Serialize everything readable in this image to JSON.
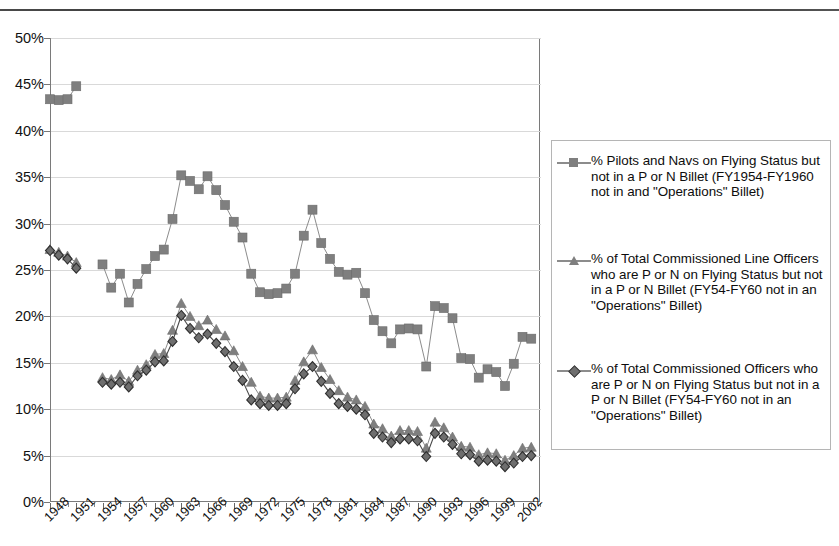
{
  "chart_data": {
    "type": "line",
    "title": "",
    "xlabel": "",
    "ylabel": "",
    "ylim": [
      0,
      50
    ],
    "ytick_labels": [
      "0%",
      "5%",
      "10%",
      "15%",
      "20%",
      "25%",
      "30%",
      "35%",
      "40%",
      "45%",
      "50%"
    ],
    "ytick_values": [
      0,
      5,
      10,
      15,
      20,
      25,
      30,
      35,
      40,
      45,
      50
    ],
    "grid": true,
    "legend_position": "right",
    "x": [
      1948,
      1949,
      1950,
      1951,
      1952,
      1953,
      1954,
      1955,
      1956,
      1957,
      1958,
      1959,
      1960,
      1961,
      1962,
      1963,
      1964,
      1965,
      1966,
      1967,
      1968,
      1969,
      1970,
      1971,
      1972,
      1973,
      1974,
      1975,
      1976,
      1977,
      1978,
      1979,
      1980,
      1981,
      1982,
      1983,
      1984,
      1985,
      1986,
      1987,
      1988,
      1989,
      1990,
      1991,
      1992,
      1993,
      1994,
      1995,
      1996,
      1997,
      1998,
      1999,
      2000,
      2001,
      2002,
      2003,
      2004
    ],
    "xtick_labels": [
      "1948",
      "1951",
      "1954",
      "1957",
      "1960",
      "1963",
      "1966",
      "1969",
      "1972",
      "1975",
      "1978",
      "1981",
      "1984",
      "1987",
      "1990",
      "1993",
      "1996",
      "1999",
      "2002"
    ],
    "xtick_values": [
      1948,
      1951,
      1954,
      1957,
      1960,
      1963,
      1966,
      1969,
      1972,
      1975,
      1978,
      1981,
      1984,
      1987,
      1990,
      1993,
      1996,
      1999,
      2002
    ],
    "series": [
      {
        "name": "% Pilots and Navs on Flying Status but not in a P or N Billet (FY1954-FY1960 not in and \"Operations\" Billet)",
        "marker": "square",
        "color": "#7f7f7f",
        "values": [
          43.4,
          43.3,
          43.4,
          44.8,
          null,
          null,
          25.6,
          23.1,
          24.6,
          21.5,
          23.5,
          25.1,
          26.5,
          27.2,
          30.5,
          35.2,
          34.6,
          33.7,
          35.1,
          33.6,
          32.0,
          30.2,
          28.5,
          24.6,
          22.6,
          22.4,
          22.5,
          23.0,
          24.6,
          28.7,
          31.5,
          27.9,
          26.2,
          24.8,
          24.5,
          24.7,
          22.5,
          19.6,
          18.4,
          17.1,
          18.6,
          18.7,
          18.6,
          14.6,
          21.1,
          20.9,
          19.8,
          15.5,
          15.4,
          13.4,
          14.3,
          14.0,
          12.5,
          14.9,
          17.8,
          17.6,
          null
        ]
      },
      {
        "name": "% of Total Commissioned Line Officers who are P or N on Flying Status but not in a P or N Billet (FY54-FY60 not in an \"Operations\" Billet)",
        "marker": "triangle",
        "color": "#7f7f7f",
        "values": [
          27.2,
          26.9,
          26.5,
          25.8,
          null,
          null,
          13.4,
          13.2,
          13.7,
          13.0,
          14.2,
          14.8,
          15.9,
          16.0,
          18.5,
          21.4,
          20.0,
          19.0,
          19.6,
          18.6,
          17.9,
          16.3,
          14.6,
          12.9,
          11.4,
          11.2,
          11.2,
          11.3,
          13.1,
          15.1,
          16.4,
          14.5,
          13.2,
          12.0,
          11.3,
          11.0,
          10.3,
          8.4,
          7.9,
          7.1,
          7.7,
          7.7,
          7.6,
          5.8,
          8.6,
          8.0,
          7.0,
          6.0,
          5.9,
          5.1,
          5.3,
          5.2,
          4.5,
          5.0,
          5.8,
          5.9,
          null
        ]
      },
      {
        "name": "% of Total Commissioned Officers who are P or N on Flying Status but not in a P or N Billet (FY54-FY60 not in an \"Operations\" Billet)",
        "marker": "diamond",
        "color": "#6e6e6e",
        "values": [
          27.1,
          26.6,
          26.2,
          25.2,
          null,
          null,
          12.9,
          12.7,
          12.9,
          12.4,
          13.6,
          14.2,
          15.1,
          15.2,
          17.3,
          20.1,
          18.7,
          17.7,
          18.1,
          17.1,
          16.2,
          14.6,
          13.1,
          11.0,
          10.6,
          10.4,
          10.4,
          10.6,
          12.2,
          13.8,
          14.6,
          13.0,
          11.7,
          10.6,
          10.3,
          10.0,
          9.4,
          7.4,
          7.0,
          6.4,
          6.8,
          6.8,
          6.6,
          4.9,
          7.4,
          7.0,
          6.2,
          5.2,
          5.1,
          4.4,
          4.5,
          4.4,
          3.8,
          4.2,
          4.9,
          5.0,
          null
        ]
      }
    ]
  },
  "legend": {
    "entries": [
      {
        "marker_name": "square-marker",
        "label": "% Pilots and Navs on Flying Status but not in a P or N Billet (FY1954-FY1960 not in and \"Operations\" Billet)"
      },
      {
        "marker_name": "triangle-marker",
        "label": "% of Total Commissioned Line Officers who are P or N on Flying Status but not in a P or N Billet (FY54-FY60 not in an \"Operations\" Billet)"
      },
      {
        "marker_name": "diamond-marker",
        "label": "% of Total Commissioned Officers who are P or N on Flying Status but not in a P or N Billet (FY54-FY60 not in an \"Operations\" Billet)"
      }
    ]
  },
  "colors": {
    "series_gray": "#7f7f7f",
    "diamond_gray": "#6e6e6e",
    "gridline": "#d9d9d9",
    "axis": "#7a7a7a",
    "text": "#111111"
  }
}
